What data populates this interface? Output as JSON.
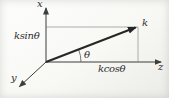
{
  "figure": {
    "axes": {
      "x_label": "x",
      "y_label": "y",
      "z_label": "z"
    },
    "vector": {
      "label": "k"
    },
    "angle": {
      "label": "θ"
    },
    "components": {
      "x_projection": "ksinθ",
      "z_projection": "kcosθ"
    },
    "colors": {
      "axis": "#3d3d3d",
      "vector": "#262626",
      "projection": "#9b9b9b",
      "arc": "#5a5a5a",
      "text": "#2d2d2d"
    }
  }
}
